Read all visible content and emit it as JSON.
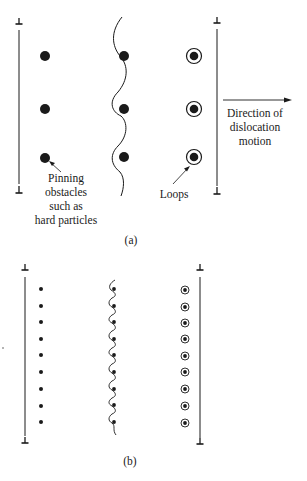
{
  "panel_a": {
    "caption": "(a)",
    "annotations": {
      "pinning": [
        "Pinning",
        "obstacles",
        "such as",
        "hard particles"
      ],
      "loops": "Loops",
      "direction": [
        "Direction of",
        "dislocation",
        "motion"
      ]
    },
    "rows_y": [
      56,
      109,
      157
    ]
  },
  "panel_b": {
    "caption": "(b)",
    "rows_y": [
      289,
      306,
      322,
      339,
      355,
      372,
      389,
      405,
      422
    ]
  },
  "colors": {
    "ink": "#1a1a1a",
    "background": "#ffffff"
  },
  "icons": {
    "dislocation_symbol": "perpendicular-tee",
    "arrow": "right-arrow"
  }
}
